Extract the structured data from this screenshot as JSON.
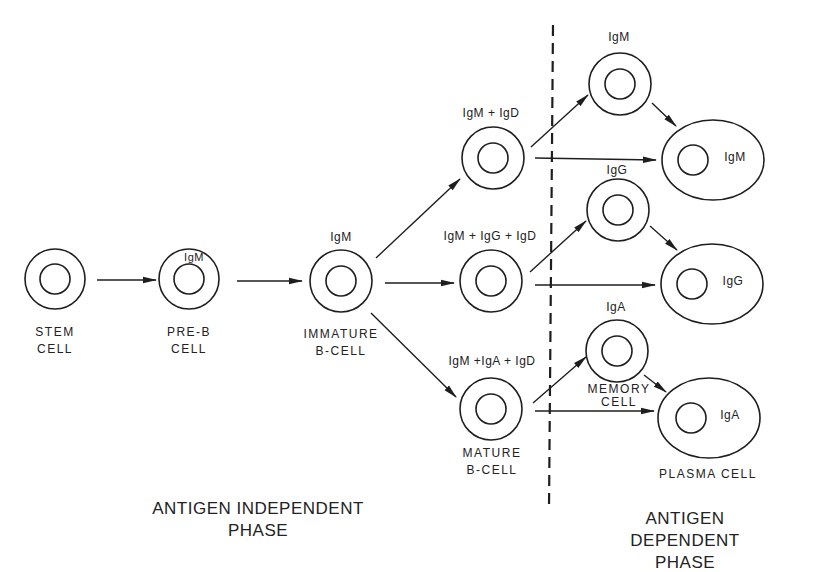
{
  "diagram": {
    "type": "flowchart",
    "colors": {
      "stroke": "#1e1e1e",
      "background": "#ffffff"
    },
    "cells": [
      {
        "id": "stem",
        "label": "STEM\nCELL",
        "ig": ""
      },
      {
        "id": "pre-b",
        "label": "PRE-B\nCELL",
        "ig": "IgM"
      },
      {
        "id": "immature",
        "label": "IMMATURE\nB-CELL",
        "ig": "IgM"
      },
      {
        "id": "mature-top",
        "label": "",
        "ig": "IgM + IgD"
      },
      {
        "id": "mature-mid",
        "label": "",
        "ig": "IgM + IgG + IgD"
      },
      {
        "id": "mature-bottom",
        "label": "MATURE\nB-CELL",
        "ig": "IgM +IgA + IgD"
      },
      {
        "id": "memory-igm",
        "label": "",
        "ig": "IgM"
      },
      {
        "id": "memory-igg",
        "label": "",
        "ig": "IgG"
      },
      {
        "id": "memory-iga",
        "label": "MEMORY\nCELL",
        "ig": "IgA"
      },
      {
        "id": "plasma-igm",
        "label": "",
        "ig": "IgM"
      },
      {
        "id": "plasma-igg",
        "label": "",
        "ig": "IgG"
      },
      {
        "id": "plasma-iga",
        "label": "PLASMA CELL",
        "ig": "IgA"
      }
    ],
    "edges": [
      [
        "stem",
        "pre-b"
      ],
      [
        "pre-b",
        "immature"
      ],
      [
        "immature",
        "mature-top"
      ],
      [
        "immature",
        "mature-mid"
      ],
      [
        "immature",
        "mature-bottom"
      ],
      [
        "mature-top",
        "memory-igm"
      ],
      [
        "mature-top",
        "plasma-igm"
      ],
      [
        "memory-igm",
        "plasma-igm"
      ],
      [
        "mature-mid",
        "memory-igg"
      ],
      [
        "mature-mid",
        "plasma-igg"
      ],
      [
        "memory-igg",
        "plasma-igg"
      ],
      [
        "mature-bottom",
        "memory-iga"
      ],
      [
        "mature-bottom",
        "plasma-iga"
      ],
      [
        "memory-iga",
        "plasma-iga"
      ]
    ],
    "phases": [
      {
        "id": "independent",
        "label": "ANTIGEN INDEPENDENT\nPHASE"
      },
      {
        "id": "dependent",
        "label": "ANTIGEN DEPENDENT\nPHASE"
      }
    ]
  }
}
